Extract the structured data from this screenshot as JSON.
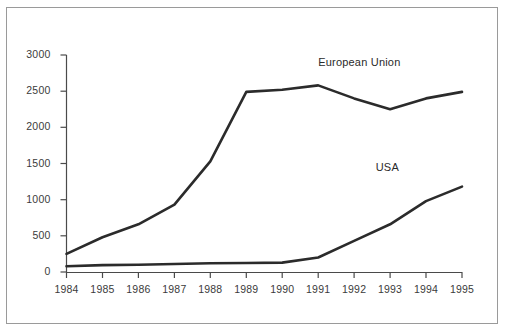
{
  "chart_data": {
    "type": "line",
    "title": "",
    "subtitle": "",
    "xlabel": "",
    "ylabel": "",
    "categories": [
      "1984",
      "1985",
      "1986",
      "1987",
      "1988",
      "1989",
      "1990",
      "1991",
      "1992",
      "1993",
      "1994",
      "1995"
    ],
    "x": [
      1984,
      1985,
      1986,
      1987,
      1988,
      1989,
      1990,
      1991,
      1992,
      1993,
      1994,
      1995
    ],
    "xlim": [
      1984,
      1995
    ],
    "ylim": [
      0,
      3000
    ],
    "yticks": [
      0,
      500,
      1000,
      1500,
      2000,
      2500,
      3000
    ],
    "ytick_labels": [
      "0",
      "500",
      "1000",
      "1500",
      "2000",
      "2500",
      "3000"
    ],
    "grid": false,
    "legend_position": "inline-annotation",
    "series": [
      {
        "name": "European Union",
        "color": "#2b2b2b",
        "values": [
          250,
          480,
          660,
          930,
          1530,
          2490,
          2520,
          2580,
          2400,
          2250,
          2400,
          2490
        ]
      },
      {
        "name": "USA",
        "color": "#2b2b2b",
        "values": [
          80,
          95,
          100,
          110,
          120,
          125,
          130,
          200,
          430,
          660,
          980,
          1180
        ]
      }
    ],
    "annotations": [
      {
        "text": "European Union",
        "x": 1991.0,
        "y": 2870
      },
      {
        "text": "USA",
        "x": 1992.6,
        "y": 1420
      }
    ]
  },
  "style": {
    "frame_color": "#9a9a9a",
    "axis_color": "#4a4a4a",
    "tick_label_color": "#3b3b3b",
    "line_color": "#2b2b2b",
    "background": "#ffffff"
  }
}
